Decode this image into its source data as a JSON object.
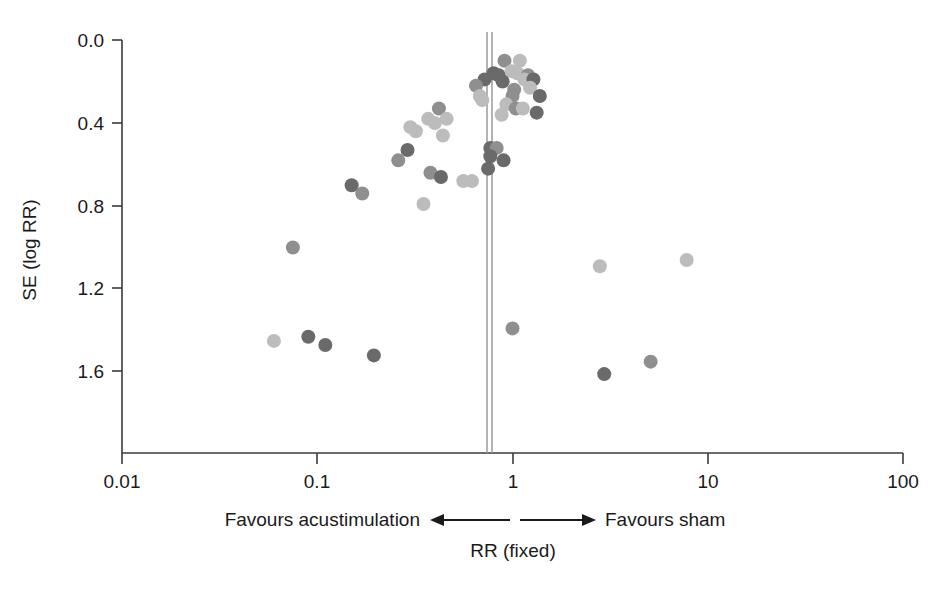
{
  "chart_data": {
    "type": "scatter",
    "title": "",
    "subtitle": "",
    "xlabel": "RR (fixed)",
    "ylabel": "SE (log RR)",
    "x_scale": "log",
    "xlim": [
      0.01,
      100
    ],
    "ylim_top": 0.0,
    "ylim_bottom": 2.0,
    "y_axis_inverted": true,
    "grid": false,
    "legend": null,
    "x_tick_values": [
      0.01,
      0.1,
      1,
      10,
      100
    ],
    "x_tick_labels": [
      "0.01",
      "0.1",
      "1",
      "10",
      "100"
    ],
    "y_tick_values": [
      0.0,
      0.4,
      0.8,
      1.2,
      1.6
    ],
    "y_tick_labels": [
      "0.0",
      "0.4",
      "0.8",
      "1.2",
      "1.6"
    ],
    "reference_line": {
      "x": 0.75,
      "label": "pooled fixed-effect RR",
      "style": "double-vertical-grey"
    },
    "annotations": {
      "left_direction": "Favours acustimulation",
      "right_direction": "Favours sham",
      "left_arrow": "←",
      "right_arrow": "→"
    },
    "colors": {
      "dot_dark": "#6a6a6a",
      "dot_mid": "#8f8f8f",
      "dot_light": "#bcbcbc",
      "axis": "#3a3a3a",
      "reference": "#9a9a9a",
      "background": "#ffffff"
    },
    "point_count": 52,
    "points": [
      {
        "rr": 0.91,
        "se": 0.1,
        "shade": "mid"
      },
      {
        "rr": 1.09,
        "se": 0.1,
        "shade": "light"
      },
      {
        "rr": 0.8,
        "se": 0.16,
        "shade": "dark"
      },
      {
        "rr": 0.85,
        "se": 0.17,
        "shade": "dark"
      },
      {
        "rr": 0.99,
        "se": 0.15,
        "shade": "light"
      },
      {
        "rr": 1.06,
        "se": 0.16,
        "shade": "light"
      },
      {
        "rr": 1.2,
        "se": 0.17,
        "shade": "mid"
      },
      {
        "rr": 0.72,
        "se": 0.19,
        "shade": "dark"
      },
      {
        "rr": 0.89,
        "se": 0.2,
        "shade": "dark"
      },
      {
        "rr": 1.15,
        "se": 0.19,
        "shade": "light"
      },
      {
        "rr": 1.28,
        "se": 0.19,
        "shade": "dark"
      },
      {
        "rr": 0.65,
        "se": 0.22,
        "shade": "mid"
      },
      {
        "rr": 1.02,
        "se": 0.24,
        "shade": "mid"
      },
      {
        "rr": 1.23,
        "se": 0.23,
        "shade": "light"
      },
      {
        "rr": 0.68,
        "se": 0.27,
        "shade": "light"
      },
      {
        "rr": 0.7,
        "se": 0.29,
        "shade": "light"
      },
      {
        "rr": 1.0,
        "se": 0.27,
        "shade": "mid"
      },
      {
        "rr": 1.38,
        "se": 0.27,
        "shade": "dark"
      },
      {
        "rr": 0.93,
        "se": 0.31,
        "shade": "light"
      },
      {
        "rr": 1.04,
        "se": 0.33,
        "shade": "mid"
      },
      {
        "rr": 1.13,
        "se": 0.33,
        "shade": "light"
      },
      {
        "rr": 1.33,
        "se": 0.35,
        "shade": "dark"
      },
      {
        "rr": 0.88,
        "se": 0.36,
        "shade": "light"
      },
      {
        "rr": 0.42,
        "se": 0.33,
        "shade": "mid"
      },
      {
        "rr": 0.46,
        "se": 0.38,
        "shade": "light"
      },
      {
        "rr": 0.37,
        "se": 0.38,
        "shade": "light"
      },
      {
        "rr": 0.4,
        "se": 0.4,
        "shade": "light"
      },
      {
        "rr": 0.3,
        "se": 0.42,
        "shade": "light"
      },
      {
        "rr": 0.32,
        "se": 0.44,
        "shade": "light"
      },
      {
        "rr": 0.44,
        "se": 0.46,
        "shade": "light"
      },
      {
        "rr": 0.77,
        "se": 0.52,
        "shade": "dark"
      },
      {
        "rr": 0.83,
        "se": 0.52,
        "shade": "mid"
      },
      {
        "rr": 0.77,
        "se": 0.56,
        "shade": "dark"
      },
      {
        "rr": 0.9,
        "se": 0.58,
        "shade": "dark"
      },
      {
        "rr": 0.75,
        "se": 0.62,
        "shade": "dark"
      },
      {
        "rr": 0.29,
        "se": 0.53,
        "shade": "dark"
      },
      {
        "rr": 0.26,
        "se": 0.58,
        "shade": "mid"
      },
      {
        "rr": 0.38,
        "se": 0.64,
        "shade": "mid"
      },
      {
        "rr": 0.43,
        "se": 0.66,
        "shade": "dark"
      },
      {
        "rr": 0.15,
        "se": 0.7,
        "shade": "dark"
      },
      {
        "rr": 0.17,
        "se": 0.74,
        "shade": "mid"
      },
      {
        "rr": 0.35,
        "se": 0.79,
        "shade": "light"
      },
      {
        "rr": 0.56,
        "se": 0.68,
        "shade": "light"
      },
      {
        "rr": 0.62,
        "se": 0.68,
        "shade": "light"
      },
      {
        "rr": 0.075,
        "se": 1.0,
        "shade": "mid"
      },
      {
        "rr": 2.8,
        "se": 1.09,
        "shade": "light"
      },
      {
        "rr": 7.8,
        "se": 1.06,
        "shade": "light"
      },
      {
        "rr": 0.06,
        "se": 1.45,
        "shade": "light"
      },
      {
        "rr": 0.09,
        "se": 1.43,
        "shade": "dark"
      },
      {
        "rr": 0.11,
        "se": 1.47,
        "shade": "dark"
      },
      {
        "rr": 0.195,
        "se": 1.52,
        "shade": "dark"
      },
      {
        "rr": 1.0,
        "se": 1.39,
        "shade": "mid"
      },
      {
        "rr": 2.95,
        "se": 1.61,
        "shade": "dark"
      },
      {
        "rr": 5.1,
        "se": 1.55,
        "shade": "mid"
      }
    ]
  },
  "axes": {
    "y_axis_title": "SE (log RR)",
    "x_axis_title": "RR (fixed)"
  },
  "footer": {
    "favours_left": "Favours acustimulation",
    "favours_right": "Favours sham",
    "x_axis_caption": "RR (fixed)"
  }
}
